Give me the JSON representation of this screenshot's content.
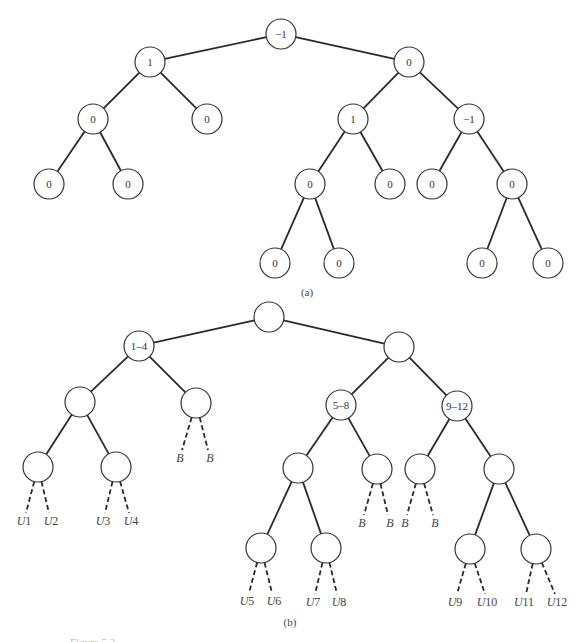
{
  "figure": {
    "partial_caption": "Figure 5.2",
    "panel_a": {
      "caption": "(a)",
      "nodes": [
        {
          "id": "a0",
          "label": "−1",
          "x": 281,
          "y": 34
        },
        {
          "id": "a1",
          "label": "1",
          "x": 150,
          "y": 62
        },
        {
          "id": "a2",
          "label": "0",
          "x": 409,
          "y": 62
        },
        {
          "id": "a3",
          "label": "0",
          "x": 93,
          "y": 119
        },
        {
          "id": "a4",
          "label": "0",
          "x": 207,
          "y": 119
        },
        {
          "id": "a5",
          "label": "1",
          "x": 353,
          "y": 119
        },
        {
          "id": "a6",
          "label": "−1",
          "x": 469,
          "y": 119
        },
        {
          "id": "a7",
          "label": "0",
          "x": 49,
          "y": 184
        },
        {
          "id": "a8",
          "label": "0",
          "x": 128,
          "y": 184
        },
        {
          "id": "a9",
          "label": "0",
          "x": 310,
          "y": 184
        },
        {
          "id": "a10",
          "label": "0",
          "x": 390,
          "y": 184
        },
        {
          "id": "a11",
          "label": "0",
          "x": 432,
          "y": 184
        },
        {
          "id": "a12",
          "label": "0",
          "x": 512,
          "y": 184
        },
        {
          "id": "a13",
          "label": "0",
          "x": 275,
          "y": 263
        },
        {
          "id": "a14",
          "label": "0",
          "x": 339,
          "y": 263
        },
        {
          "id": "a15",
          "label": "0",
          "x": 482,
          "y": 263
        },
        {
          "id": "a16",
          "label": "0",
          "x": 548,
          "y": 263
        }
      ],
      "edges": [
        [
          "a0",
          "a1"
        ],
        [
          "a0",
          "a2"
        ],
        [
          "a1",
          "a3"
        ],
        [
          "a1",
          "a4"
        ],
        [
          "a2",
          "a5"
        ],
        [
          "a2",
          "a6"
        ],
        [
          "a3",
          "a7"
        ],
        [
          "a3",
          "a8"
        ],
        [
          "a5",
          "a9"
        ],
        [
          "a5",
          "a10"
        ],
        [
          "a6",
          "a11"
        ],
        [
          "a6",
          "a12"
        ],
        [
          "a9",
          "a13"
        ],
        [
          "a9",
          "a14"
        ],
        [
          "a12",
          "a15"
        ],
        [
          "a12",
          "a16"
        ]
      ]
    },
    "panel_b": {
      "caption": "(b)",
      "nodes": [
        {
          "id": "b0",
          "label": "",
          "x": 269,
          "y": 317
        },
        {
          "id": "b1",
          "label": "1–4",
          "x": 139,
          "y": 346
        },
        {
          "id": "b2",
          "label": "",
          "x": 399,
          "y": 347
        },
        {
          "id": "b3",
          "label": "",
          "x": 80,
          "y": 402
        },
        {
          "id": "b4",
          "label": "",
          "x": 196,
          "y": 403
        },
        {
          "id": "b5",
          "label": "5–8",
          "x": 341,
          "y": 405
        },
        {
          "id": "b6",
          "label": "9–12",
          "x": 457,
          "y": 406
        },
        {
          "id": "b7",
          "label": "",
          "x": 38,
          "y": 467
        },
        {
          "id": "b8",
          "label": "",
          "x": 116,
          "y": 467
        },
        {
          "id": "b9",
          "label": "",
          "x": 298,
          "y": 468
        },
        {
          "id": "b10",
          "label": "",
          "x": 377,
          "y": 469
        },
        {
          "id": "b11",
          "label": "",
          "x": 420,
          "y": 469
        },
        {
          "id": "b12",
          "label": "",
          "x": 499,
          "y": 469
        },
        {
          "id": "b13",
          "label": "",
          "x": 261,
          "y": 548
        },
        {
          "id": "b14",
          "label": "",
          "x": 326,
          "y": 548
        },
        {
          "id": "b15",
          "label": "",
          "x": 470,
          "y": 549
        },
        {
          "id": "b16",
          "label": "",
          "x": 536,
          "y": 549
        }
      ],
      "edges": [
        [
          "b0",
          "b1"
        ],
        [
          "b0",
          "b2"
        ],
        [
          "b1",
          "b3"
        ],
        [
          "b1",
          "b4"
        ],
        [
          "b2",
          "b5"
        ],
        [
          "b2",
          "b6"
        ],
        [
          "b3",
          "b7"
        ],
        [
          "b3",
          "b8"
        ],
        [
          "b5",
          "b9"
        ],
        [
          "b5",
          "b10"
        ],
        [
          "b6",
          "b11"
        ],
        [
          "b6",
          "b12"
        ],
        [
          "b9",
          "b13"
        ],
        [
          "b9",
          "b14"
        ],
        [
          "b12",
          "b15"
        ],
        [
          "b12",
          "b16"
        ]
      ],
      "dashed_leaves": [
        {
          "parent": "b7",
          "label": "U1",
          "x": 24,
          "y": 525
        },
        {
          "parent": "b7",
          "label": "U2",
          "x": 51,
          "y": 525
        },
        {
          "parent": "b8",
          "label": "U3",
          "x": 103,
          "y": 525
        },
        {
          "parent": "b8",
          "label": "U4",
          "x": 131,
          "y": 525
        },
        {
          "parent": "b4",
          "label": "B",
          "x": 180,
          "y": 462
        },
        {
          "parent": "b4",
          "label": "B",
          "x": 210,
          "y": 462
        },
        {
          "parent": "b10",
          "label": "B",
          "x": 362,
          "y": 527
        },
        {
          "parent": "b10",
          "label": "B",
          "x": 390,
          "y": 527
        },
        {
          "parent": "b11",
          "label": "B",
          "x": 405,
          "y": 527
        },
        {
          "parent": "b11",
          "label": "B",
          "x": 435,
          "y": 527
        },
        {
          "parent": "b13",
          "label": "U5",
          "x": 247,
          "y": 605
        },
        {
          "parent": "b13",
          "label": "U6",
          "x": 274,
          "y": 605
        },
        {
          "parent": "b14",
          "label": "U7",
          "x": 313,
          "y": 606
        },
        {
          "parent": "b14",
          "label": "U8",
          "x": 339,
          "y": 606
        },
        {
          "parent": "b15",
          "label": "U9",
          "x": 455,
          "y": 606
        },
        {
          "parent": "b15",
          "label": "U10",
          "x": 487,
          "y": 606
        },
        {
          "parent": "b16",
          "label": "U11",
          "x": 524,
          "y": 606
        },
        {
          "parent": "b16",
          "label": "U12",
          "x": 557,
          "y": 606
        }
      ]
    },
    "caption_positions": {
      "a": {
        "x": 307,
        "y": 296
      },
      "b": {
        "x": 290,
        "y": 626
      }
    },
    "node_radius": 15,
    "colors": {
      "stroke": "#2a2a2a",
      "text": "#333333",
      "background": "#ffffff"
    }
  }
}
